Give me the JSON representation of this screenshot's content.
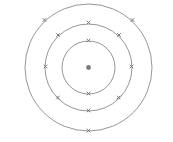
{
  "diagram": {
    "type": "bohr-atom-model",
    "width": 173,
    "height": 142,
    "colors": {
      "background": "#ffffff",
      "shell": "#8a8a8a",
      "electron": "#6e6e6e",
      "nucleus": "#7a7a7a"
    },
    "nucleus": {
      "cx": 88.5,
      "cy": 67.5,
      "r": 2.4
    },
    "shells": [
      {
        "name": "shell-1",
        "r": 26.5,
        "electrons": [
          [
            88.5,
            40.5
          ],
          [
            88.5,
            93.5
          ]
        ]
      },
      {
        "name": "shell-2",
        "r": 43.5,
        "electrons": [
          [
            88.5,
            22.5
          ],
          [
            58,
            35
          ],
          [
            119,
            35
          ],
          [
            45.5,
            66.5
          ],
          [
            131.5,
            66.5
          ],
          [
            58,
            97.5
          ],
          [
            118.5,
            97.5
          ],
          [
            88.5,
            110.5
          ]
        ]
      },
      {
        "name": "shell-3",
        "r": 63.5,
        "electrons": [
          [
            44.5,
            20
          ],
          [
            132.5,
            20
          ],
          [
            88.5,
            130.5
          ]
        ]
      }
    ],
    "electron_counts": [
      2,
      8,
      3
    ]
  }
}
